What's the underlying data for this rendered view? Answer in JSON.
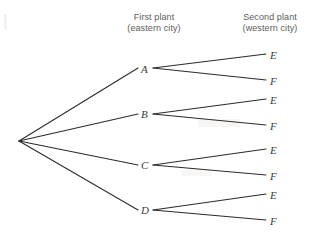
{
  "diagram": {
    "type": "probability-tree",
    "background_color": "#ffffff",
    "line_color": "#2b2b2b",
    "text_color": "#5b5b5b",
    "headers": [
      {
        "line1": "First plant",
        "line2": "(eastern city)"
      },
      {
        "line1": "Second plant",
        "line2": "(western city)"
      }
    ],
    "root": {
      "label": "",
      "x": 19,
      "y": 141
    },
    "first_level": [
      {
        "label": "A",
        "x": 144,
        "y": 70
      },
      {
        "label": "B",
        "x": 144,
        "y": 115
      },
      {
        "label": "C",
        "x": 144,
        "y": 166
      },
      {
        "label": "D",
        "x": 144,
        "y": 211
      }
    ],
    "second_level": [
      {
        "parent": "A",
        "label": "E",
        "x": 271,
        "y": 57
      },
      {
        "parent": "A",
        "label": "F",
        "x": 271,
        "y": 83
      },
      {
        "parent": "B",
        "label": "E",
        "x": 271,
        "y": 102
      },
      {
        "parent": "B",
        "label": "F",
        "x": 271,
        "y": 128
      },
      {
        "parent": "C",
        "label": "E",
        "x": 271,
        "y": 152
      },
      {
        "parent": "C",
        "label": "F",
        "x": 271,
        "y": 178
      },
      {
        "parent": "D",
        "label": "E",
        "x": 271,
        "y": 197
      },
      {
        "parent": "D",
        "label": "F",
        "x": 271,
        "y": 223
      }
    ]
  }
}
